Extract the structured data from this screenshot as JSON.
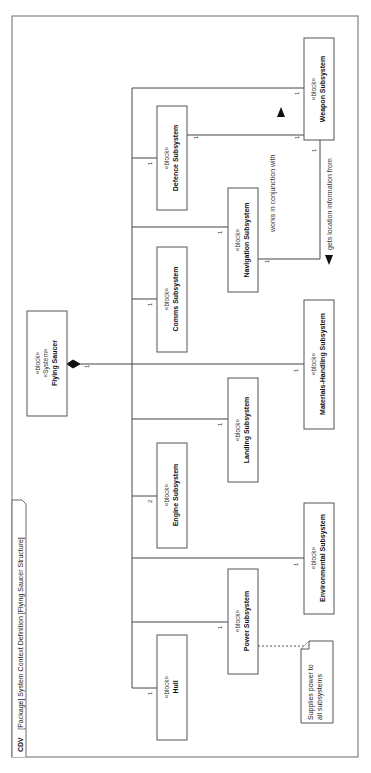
{
  "frame": {
    "kind": "CDV",
    "title": "[Package] System Context Definition [Flying Saucer Structure]"
  },
  "stereotypes": {
    "block": "«block»",
    "system": "«System»"
  },
  "root": {
    "name": "Flying Saucer",
    "multiplicity": "1"
  },
  "blocks": [
    {
      "id": "hull",
      "name": "Hull",
      "multiplicity": "1"
    },
    {
      "id": "power",
      "name": "Power Subsystem",
      "multiplicity": "1"
    },
    {
      "id": "environmental",
      "name": "Environmental Subsystem",
      "multiplicity": "1"
    },
    {
      "id": "engine",
      "name": "Engine Subsystem",
      "multiplicity": "2"
    },
    {
      "id": "landing",
      "name": "Landing Subsystem",
      "multiplicity": "1"
    },
    {
      "id": "materials",
      "name": "Materials-Handling Subsystem",
      "multiplicity": "1"
    },
    {
      "id": "comms",
      "name": "Comms Subsystem",
      "multiplicity": "1"
    },
    {
      "id": "navigation",
      "name": "Navigation Subsystem",
      "multiplicity": "1"
    },
    {
      "id": "defence",
      "name": "Defence Subsystem",
      "multiplicity": "1"
    },
    {
      "id": "weapon",
      "name": "Weapon Subsystem",
      "multiplicity": "1"
    }
  ],
  "associations": [
    {
      "label": "works in conjunction with",
      "from": "Defence Subsystem",
      "to": "Weapon Subsystem",
      "from_mult": "1",
      "to_mult": "1"
    },
    {
      "label": "gets location information from",
      "from": "Weapon Subsystem",
      "to": "Navigation Subsystem",
      "from_mult": "1",
      "to_mult": "1"
    }
  ],
  "note": {
    "line1": "Supplies power to",
    "line2": "all subsystems"
  }
}
